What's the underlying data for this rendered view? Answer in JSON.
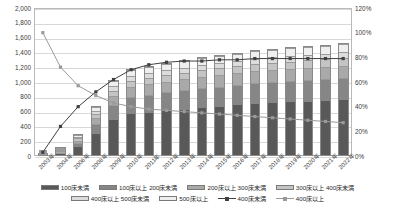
{
  "chart_data": {
    "type": "bar",
    "title": "",
    "xlabel": "",
    "ylabel": "",
    "ylim": [
      0,
      2000
    ],
    "y2lim": [
      0,
      120
    ],
    "grid": true,
    "legend_position": "bottom",
    "categories": [
      "2003年",
      "2004年",
      "2006年",
      "2008年",
      "2009年",
      "2010年",
      "2011年",
      "2012年",
      "2013年",
      "2014年",
      "2015年",
      "2016年",
      "2017年",
      "2018年",
      "2019年",
      "2020年",
      "2021年",
      "2022年"
    ],
    "yticks": [
      "0",
      "200",
      "400",
      "600",
      "800",
      "1,000",
      "1,200",
      "1,400",
      "1,600",
      "1,800",
      "2,000"
    ],
    "y2ticks": [
      "0%",
      "20%",
      "40%",
      "60%",
      "80%",
      "100%",
      "120%"
    ],
    "series": [
      {
        "name": "100床未満",
        "color": "#595959",
        "values": [
          20,
          60,
          150,
          330,
          520,
          600,
          620,
          640,
          660,
          680,
          700,
          720,
          740,
          750,
          760,
          770,
          780,
          790
        ]
      },
      {
        "name": "100床以上 200床未満",
        "color": "#868686",
        "values": [
          8,
          25,
          60,
          140,
          210,
          240,
          250,
          260,
          270,
          275,
          280,
          285,
          290,
          292,
          295,
          298,
          300,
          302
        ]
      },
      {
        "name": "200床以上 300床未満",
        "color": "#a9a9a9",
        "values": [
          5,
          15,
          35,
          80,
          115,
          130,
          135,
          140,
          142,
          145,
          148,
          150,
          152,
          154,
          156,
          158,
          160,
          162
        ]
      },
      {
        "name": "300床以上 400床未満",
        "color": "#c4c4c4",
        "values": [
          3,
          10,
          22,
          50,
          70,
          80,
          82,
          85,
          86,
          88,
          90,
          92,
          94,
          95,
          96,
          97,
          98,
          99
        ]
      },
      {
        "name": "400床以上 500床未満",
        "color": "#dcdcdc",
        "values": [
          2,
          6,
          14,
          32,
          45,
          52,
          54,
          56,
          57,
          58,
          60,
          61,
          62,
          63,
          64,
          65,
          66,
          67
        ]
      },
      {
        "name": "500床以上",
        "color": "#efefef",
        "values": [
          2,
          8,
          19,
          48,
          70,
          78,
          80,
          82,
          84,
          86,
          88,
          90,
          92,
          94,
          96,
          98,
          100,
          102
        ]
      }
    ],
    "line_series": [
      {
        "name": "400床未満",
        "color": "#404040",
        "axis": "secondary",
        "unit": "%",
        "values": [
          3,
          24,
          40,
          52,
          62,
          70,
          74,
          76,
          77,
          77,
          78,
          78,
          79,
          79,
          79,
          79,
          79,
          79
        ]
      },
      {
        "name": "400床以上",
        "color": "#9a9a9a",
        "axis": "secondary",
        "unit": "%",
        "values": [
          100,
          72,
          57,
          49,
          43,
          40,
          38,
          37,
          36,
          35,
          34,
          33,
          32,
          31,
          30,
          29,
          28,
          27
        ]
      }
    ]
  }
}
